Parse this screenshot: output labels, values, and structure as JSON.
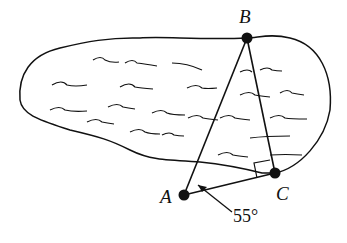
{
  "diagram": {
    "type": "geometry",
    "region": "lake",
    "points": {
      "A": {
        "label": "A",
        "x": 184,
        "y": 195
      },
      "B": {
        "label": "B",
        "x": 247,
        "y": 38
      },
      "C": {
        "label": "C",
        "x": 275,
        "y": 173
      }
    },
    "segments": [
      "AB",
      "BC",
      "AC"
    ],
    "right_angle_at": "C",
    "angle_annotation": {
      "vertex": "A",
      "text": "55°"
    },
    "colors": {
      "stroke": "#111111",
      "background": "#ffffff"
    }
  }
}
